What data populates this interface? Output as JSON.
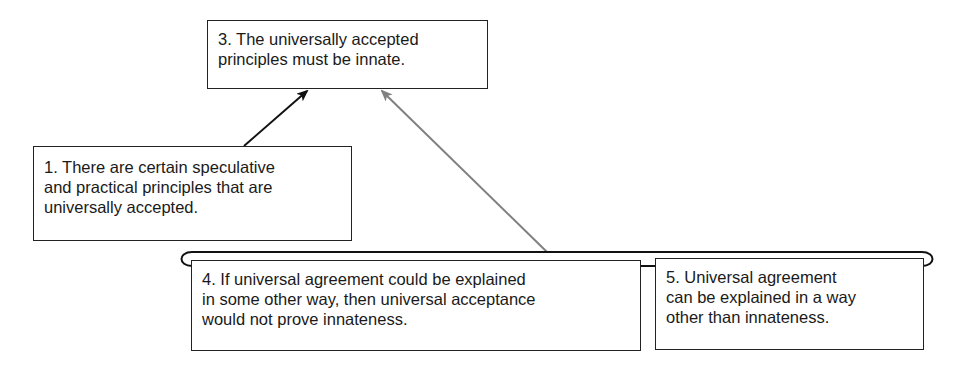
{
  "diagram": {
    "type": "argument-map",
    "nodes": [
      {
        "id": "3",
        "lines": [
          "3. The universally accepted",
          "principles must be innate."
        ]
      },
      {
        "id": "1",
        "lines": [
          "1. There are certain speculative",
          "and practical principles that are",
          "universally accepted."
        ]
      },
      {
        "id": "4",
        "lines": [
          "4. If universal agreement could be explained",
          "in some other way, then universal acceptance",
          "would not prove innateness."
        ]
      },
      {
        "id": "5",
        "lines": [
          "5. Universal agreement",
          "can be explained in a way",
          "other than innateness."
        ]
      }
    ],
    "edges": [
      {
        "from": "1",
        "to": "3",
        "color": "#111111",
        "kind": "support"
      },
      {
        "from": "4+5",
        "to": "3",
        "color": "#808080",
        "kind": "objection"
      }
    ],
    "colors": {
      "support": "#111111",
      "objection": "#808080",
      "border": "#222222"
    }
  }
}
